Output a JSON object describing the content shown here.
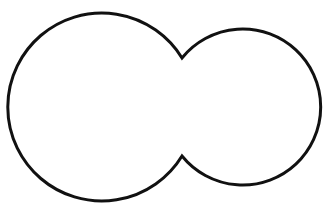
{
  "diagram": {
    "stroke_color": "#111111",
    "fill_color": "#ffffff",
    "background": "#ffffff",
    "stroke_width": 3,
    "shapes": [
      {
        "name": "left-circle",
        "cx": 104,
        "cy": 108,
        "r": 94
      },
      {
        "name": "right-circle",
        "cx": 243,
        "cy": 106,
        "r": 78
      }
    ],
    "cusps": [
      {
        "name": "top-cusp",
        "x": 182,
        "y": 58
      },
      {
        "name": "bottom-cusp",
        "x": 182,
        "y": 156
      }
    ]
  }
}
